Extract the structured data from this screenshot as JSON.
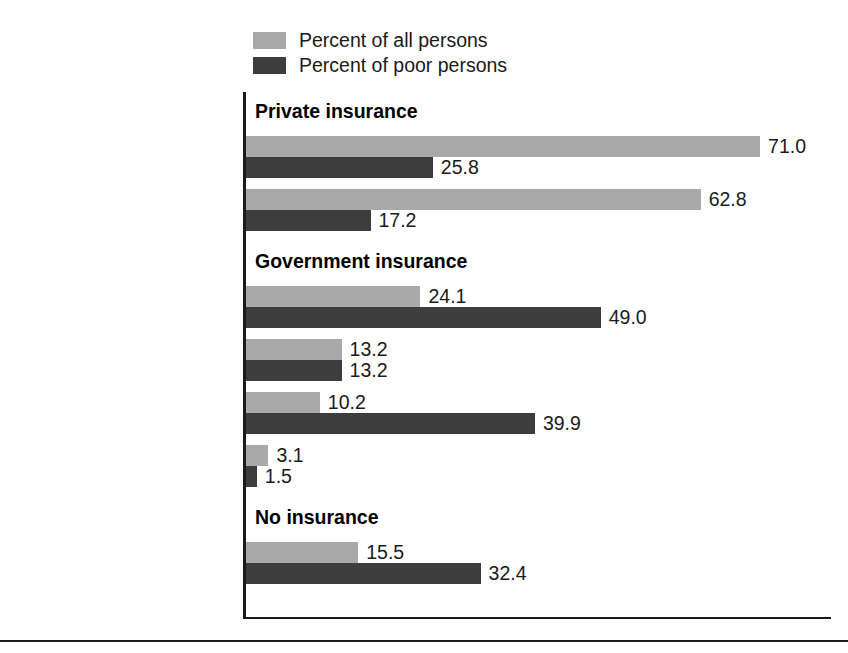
{
  "chart_data": {
    "type": "bar",
    "orientation": "horizontal",
    "title": "",
    "xlabel": "",
    "ylabel": "",
    "xlim": [
      0,
      80
    ],
    "grid": false,
    "legend_position": "top",
    "series": [
      {
        "name": "Percent of all persons",
        "key": "all",
        "color": "#a9a9a9"
      },
      {
        "name": "Percent of poor persons",
        "key": "poor",
        "color": "#3d3d3d"
      }
    ],
    "sections": [
      {
        "heading": "Private insurance",
        "categories": [
          {
            "label": "Any private plan",
            "all": 71.0,
            "poor": 25.8
          },
          {
            "label": "Employment-based",
            "all": 62.8,
            "poor": 17.2
          }
        ]
      },
      {
        "heading": "Government insurance",
        "categories": [
          {
            "label": "Any government plan",
            "all": 24.1,
            "poor": 49.0
          },
          {
            "label": "Medicare",
            "all": 13.2,
            "poor": 13.2
          },
          {
            "label": "Medicaid",
            "all": 10.2,
            "poor": 39.9
          },
          {
            "label": "Military health care*",
            "all": 3.1,
            "poor": 1.5
          }
        ]
      },
      {
        "heading": "No insurance",
        "categories": [
          {
            "label": "No insurance",
            "all": 15.5,
            "poor": 32.4
          }
        ]
      }
    ]
  },
  "legend": {
    "items": [
      {
        "label": "Percent of all persons",
        "color": "#a9a9a9"
      },
      {
        "label": "Percent of poor persons",
        "color": "#3d3d3d"
      }
    ]
  },
  "colors": {
    "all_persons": "#a9a9a9",
    "poor_persons": "#3d3d3d",
    "axis": "#1a1a1a",
    "text": "#1a1a1a",
    "background": "#ffffff"
  }
}
